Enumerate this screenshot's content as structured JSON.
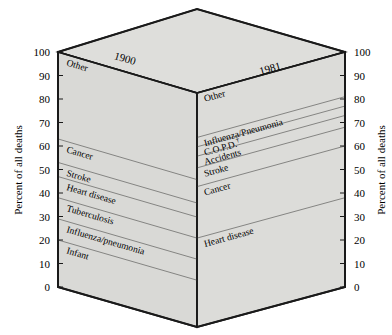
{
  "figure": {
    "type": "3d-prism-stacked-bar",
    "axis_title_left": "Percent of all deaths",
    "axis_title_right": "Percent of all deaths",
    "tick_labels": [
      "100",
      "90",
      "80",
      "70",
      "60",
      "50",
      "40",
      "30",
      "20",
      "10",
      "0"
    ],
    "tick_values": [
      100,
      90,
      80,
      70,
      60,
      50,
      40,
      30,
      20,
      10,
      0
    ],
    "panels": [
      {
        "year": "1900",
        "side": "left"
      },
      {
        "year": "1981",
        "side": "right"
      }
    ]
  },
  "chart_data": {
    "type": "bar",
    "title": "",
    "subtitle": "",
    "xlabel": "",
    "ylabel": "Percent of all deaths",
    "ylim": [
      0,
      100
    ],
    "grid": false,
    "legend": "none",
    "stacked": true,
    "categories": [
      "1900",
      "1981"
    ],
    "series": [
      {
        "name": "1900",
        "segments": [
          {
            "label": "Infant",
            "start": 0,
            "end": 20,
            "value": 20
          },
          {
            "label": "Influenza/pneumonia",
            "start": 20,
            "end": 29,
            "value": 9
          },
          {
            "label": "Tuberculosis",
            "start": 29,
            "end": 38,
            "value": 9
          },
          {
            "label": "Heart disease",
            "start": 38,
            "end": 47,
            "value": 9
          },
          {
            "label": "Stroke",
            "start": 47,
            "end": 53,
            "value": 6
          },
          {
            "label": "Cancer",
            "start": 53,
            "end": 63,
            "value": 10
          },
          {
            "label": "Other",
            "start": 63,
            "end": 100,
            "value": 37
          }
        ]
      },
      {
        "name": "1981",
        "segments": [
          {
            "label": "Heart disease",
            "start": 0,
            "end": 38,
            "value": 38
          },
          {
            "label": "Cancer",
            "start": 38,
            "end": 60,
            "value": 22
          },
          {
            "label": "Stroke",
            "start": 60,
            "end": 68,
            "value": 8
          },
          {
            "label": "Accidents",
            "start": 68,
            "end": 73,
            "value": 5
          },
          {
            "label": "C.O.P.D.",
            "start": 73,
            "end": 77,
            "value": 4,
            "footnote_marker": "†"
          },
          {
            "label": "Influenza/Pneumonia",
            "start": 77,
            "end": 81,
            "value": 4
          },
          {
            "label": "Other",
            "start": 81,
            "end": 100,
            "value": 19
          }
        ]
      }
    ]
  },
  "colors": {
    "face_left": "#d9d9d6",
    "face_right": "#dcdcd9",
    "top_face": "#dededb",
    "outline": "#1a1a1a",
    "band_line": "#7a7a78",
    "text": "#000000",
    "background": "#ffffff"
  }
}
